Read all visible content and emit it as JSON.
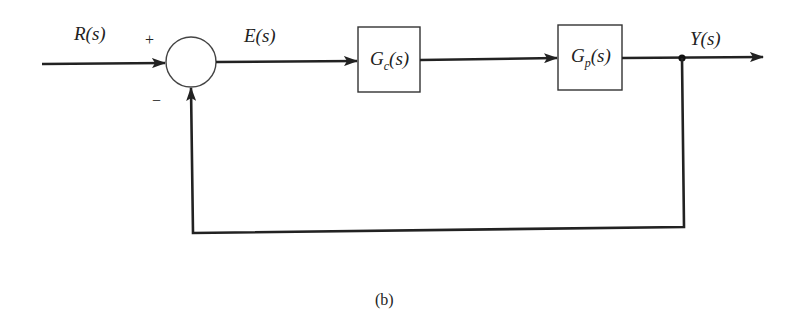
{
  "diagram": {
    "type": "feedback-control-block-diagram",
    "colors": {
      "line": "#222222",
      "box_border": "#333333",
      "background": "#ffffff"
    },
    "signals": {
      "input": "R(s)",
      "error": "E(s)",
      "output": "Y(s)"
    },
    "summing_junction": {
      "plus_sign": "+",
      "minus_sign": "−"
    },
    "blocks": [
      {
        "id": "controller",
        "base": "G",
        "subscript": "c",
        "arg": "(s)"
      },
      {
        "id": "plant",
        "base": "G",
        "subscript": "p",
        "arg": "(s)"
      }
    ],
    "caption": "(b)"
  }
}
